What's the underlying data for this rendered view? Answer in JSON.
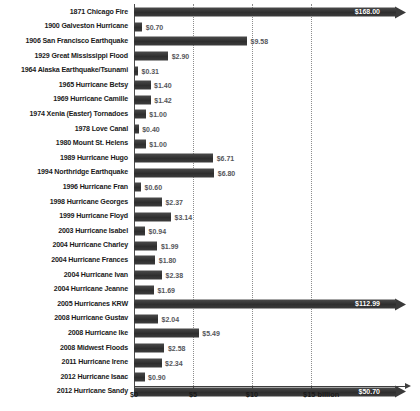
{
  "chart_data": {
    "type": "bar",
    "orientation": "horizontal",
    "title": "",
    "subtitle": "",
    "xlabel": "",
    "ylabel": "",
    "xlim": [
      0,
      23
    ],
    "axis_visible_max": 15,
    "grid": true,
    "legend": null,
    "units": "billion USD",
    "value_prefix": "$",
    "categories": [
      "1871 Chicago Fire",
      "1900 Galveston Hurricane",
      "1906 San Francisco Earthquake",
      "1929 Great Mississippi Flood",
      "1964 Alaska Earthquake/Tsunami",
      "1965 Hurricane Betsy",
      "1969 Hurricane Camille",
      "1974 Xenia (Easter) Tornadoes",
      "1978 Love Canal",
      "1980 Mount St. Helens",
      "1989 Hurricane Hugo",
      "1994 Northridge Earthquake",
      "1996 Hurricane Fran",
      "1998 Hurricane Georges",
      "1999 Hurricane Floyd",
      "2003 Hurricane Isabel",
      "2004 Hurricane Charley",
      "2004 Hurricane Frances",
      "2004 Hurricane Ivan",
      "2004 Hurricane Jeanne",
      "2005 Hurricanes KRW",
      "2008 Hurricane Gustav",
      "2008 Hurricane Ike",
      "2008 Midwest Floods",
      "2011 Hurricane Irene",
      "2012 Hurricane Isaac",
      "2012 Hurricane Sandy"
    ],
    "values": [
      168.0,
      0.7,
      9.58,
      2.9,
      0.31,
      1.4,
      1.42,
      1.0,
      0.4,
      1.0,
      6.71,
      6.8,
      0.6,
      2.37,
      3.14,
      0.94,
      1.99,
      1.8,
      2.38,
      1.69,
      112.99,
      2.04,
      5.49,
      2.58,
      2.34,
      0.9,
      50.7
    ],
    "value_labels": [
      "$168.00",
      "$0.70",
      "$9.58",
      "$2.90",
      "$0.31",
      "$1.40",
      "$1.42",
      "$1.00",
      "$0.40",
      "$1.00",
      "$6.71",
      "$6.80",
      "$0.60",
      "$2.37",
      "$3.14",
      "$0.94",
      "$1.99",
      "$1.80",
      "$2.38",
      "$1.69",
      "$112.99",
      "$2.04",
      "$5.49",
      "$2.58",
      "$2.34",
      "$0.90",
      "$50.70"
    ],
    "overflow_flags": [
      true,
      false,
      false,
      false,
      false,
      false,
      false,
      false,
      false,
      false,
      false,
      false,
      false,
      false,
      false,
      false,
      false,
      false,
      false,
      false,
      true,
      false,
      false,
      false,
      false,
      false,
      true
    ],
    "xticks": [
      0,
      5,
      10,
      15
    ],
    "xtick_labels": [
      "$0",
      "$5",
      "$10",
      "$15 billion"
    ],
    "colors": {
      "bar": "#3a3a3a",
      "value_label": "#55565a",
      "overflow_value_label": "#ffffff",
      "category_label": "#1a1a1a",
      "gridline": "#8d8d8d",
      "axis": "#3f3f3f",
      "background": "#ffffff"
    }
  }
}
